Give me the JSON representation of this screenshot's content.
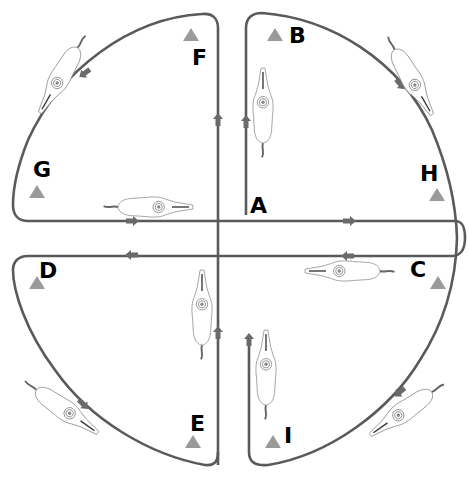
{
  "diagram": {
    "type": "riding arena figure / dressage pattern",
    "colors": {
      "track": "#5a5a5a",
      "arrow": "#6a6a6a",
      "cone": "#9a9a9a",
      "letter": "#000000",
      "horse_outline": "#888888"
    },
    "markers": [
      {
        "id": "A",
        "label": "A",
        "x": 250,
        "y": 195
      },
      {
        "id": "B",
        "label": "B",
        "x": 289,
        "y": 25
      },
      {
        "id": "C",
        "label": "C",
        "x": 410,
        "y": 259
      },
      {
        "id": "D",
        "label": "D",
        "x": 39,
        "y": 260
      },
      {
        "id": "E",
        "label": "E",
        "x": 190,
        "y": 413
      },
      {
        "id": "F",
        "label": "F",
        "x": 192,
        "y": 47
      },
      {
        "id": "G",
        "label": "G",
        "x": 33,
        "y": 159
      },
      {
        "id": "H",
        "label": "H",
        "x": 420,
        "y": 163
      },
      {
        "id": "I",
        "label": "I",
        "x": 284,
        "y": 425
      }
    ],
    "cones": [
      {
        "near": "B",
        "x": 275,
        "y": 35
      },
      {
        "near": "F",
        "x": 191,
        "y": 35
      },
      {
        "near": "G",
        "x": 37,
        "y": 192
      },
      {
        "near": "H",
        "x": 437,
        "y": 195
      },
      {
        "near": "C",
        "x": 438,
        "y": 283
      },
      {
        "near": "D",
        "x": 37,
        "y": 283
      },
      {
        "near": "E",
        "x": 193,
        "y": 442
      },
      {
        "near": "I",
        "x": 273,
        "y": 442
      }
    ],
    "arrows": [
      {
        "x": 218,
        "y": 120,
        "dir": "up"
      },
      {
        "x": 246,
        "y": 122,
        "dir": "up"
      },
      {
        "x": 132,
        "y": 221,
        "dir": "right"
      },
      {
        "x": 349,
        "y": 221,
        "dir": "right"
      },
      {
        "x": 348,
        "y": 256,
        "dir": "left"
      },
      {
        "x": 132,
        "y": 255,
        "dir": "left"
      },
      {
        "x": 218,
        "y": 333,
        "dir": "up"
      },
      {
        "x": 249,
        "y": 335,
        "dir": "up"
      },
      {
        "x": 85,
        "y": 73,
        "dir": "down-left"
      },
      {
        "x": 400,
        "y": 84,
        "dir": "down-right"
      },
      {
        "x": 400,
        "y": 392,
        "dir": "down-left"
      },
      {
        "x": 83,
        "y": 404,
        "dir": "down-right"
      }
    ],
    "horses": [
      {
        "x": 263,
        "y": 108,
        "rotation": 0,
        "facing": "up"
      },
      {
        "x": 153,
        "y": 207,
        "rotation": 90,
        "facing": "right"
      },
      {
        "x": 345,
        "y": 271,
        "rotation": -90,
        "facing": "left"
      },
      {
        "x": 202,
        "y": 310,
        "rotation": 0,
        "facing": "up"
      },
      {
        "x": 266,
        "y": 370,
        "rotation": 0,
        "facing": "up"
      },
      {
        "x": 55,
        "y": 78,
        "rotation": -150,
        "facing": "down-left"
      },
      {
        "x": 414,
        "y": 78,
        "rotation": 150,
        "facing": "down-right"
      },
      {
        "x": 405,
        "y": 413,
        "rotation": -120,
        "facing": "down-left"
      },
      {
        "x": 62,
        "y": 410,
        "rotation": 120,
        "facing": "down-right"
      }
    ]
  }
}
